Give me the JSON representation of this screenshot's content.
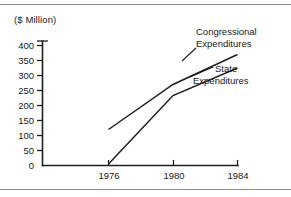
{
  "chart_data": {
    "type": "line",
    "title": "",
    "subtitle": "",
    "xlabel": "",
    "ylabel": "($ Million)",
    "unit_note": "($ Million)",
    "x": [
      1976,
      1980,
      1984
    ],
    "xtick_labels": [
      "1976",
      "1980",
      "1984"
    ],
    "ytick_labels": [
      "0",
      "50",
      "100",
      "150",
      "200",
      "250",
      "300",
      "350",
      "400"
    ],
    "ytick_values": [
      0,
      50,
      100,
      150,
      200,
      250,
      300,
      350,
      400
    ],
    "xlim": [
      1975.0,
      1984.8
    ],
    "ylim": [
      0,
      420
    ],
    "grid": false,
    "legend_position": "inline-annotations",
    "series": [
      {
        "name": "Congressional Expenditures",
        "label_line1": "Congressional",
        "label_line2": "Expenditures",
        "values": [
          120,
          270,
          370
        ],
        "color": "#1f1f1f"
      },
      {
        "name": "State Expenditures",
        "label_line1": "State",
        "label_line2": "Expenditures",
        "values": [
          5,
          233,
          325
        ],
        "color": "#1f1f1f"
      }
    ],
    "annotations": [
      {
        "text": "Congressional Expenditures",
        "points_to_series": "Congressional Expenditures"
      },
      {
        "text": "State Expenditures",
        "points_to_series": "State Expenditures"
      }
    ]
  },
  "colors": {
    "line": "#1f1f1f",
    "axis": "#1f1f1f",
    "rule": "#8a8a8a",
    "background": "#ffffff"
  }
}
